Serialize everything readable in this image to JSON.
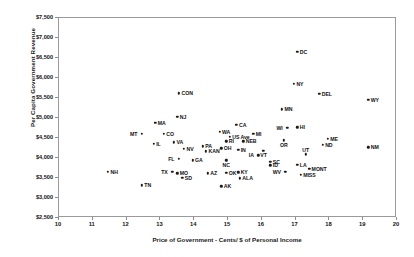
{
  "chart_data": {
    "type": "scatter",
    "title": "",
    "xlabel": "Price of Government - Cents/ $ of Personal Income",
    "ylabel": "Per Capita Government Revenue",
    "xlim": [
      10,
      20
    ],
    "ylim": [
      2500,
      7500
    ],
    "xticks": [
      "10",
      "11",
      "12",
      "13",
      "14",
      "15",
      "16",
      "17",
      "18",
      "19",
      "20"
    ],
    "yticks": [
      "$2,500",
      "$3,000",
      "$3,500",
      "$4,000",
      "$4,500",
      "$5,000",
      "$5,500",
      "$6,000",
      "$6,500",
      "$7,000",
      "$7,500"
    ],
    "grid": false,
    "legend": "none",
    "marker_color": "#1c1c1c",
    "frame_color": "#9a9a9a",
    "points": [
      {
        "label": "DC",
        "x": 17.05,
        "y": 6650,
        "side": "right"
      },
      {
        "label": "NY",
        "x": 16.95,
        "y": 5850,
        "side": "right"
      },
      {
        "label": "DEL",
        "x": 17.7,
        "y": 5600,
        "side": "right"
      },
      {
        "label": "WY",
        "x": 19.15,
        "y": 5450,
        "side": "right"
      },
      {
        "label": "CON",
        "x": 13.55,
        "y": 5620,
        "side": "right"
      },
      {
        "label": "NJ",
        "x": 13.5,
        "y": 5030,
        "side": "right"
      },
      {
        "label": "MA",
        "x": 12.85,
        "y": 4880,
        "side": "right"
      },
      {
        "label": "MN",
        "x": 16.6,
        "y": 5220,
        "side": "right"
      },
      {
        "label": "CA",
        "x": 15.25,
        "y": 4830,
        "side": "right"
      },
      {
        "label": "WI",
        "x": 16.75,
        "y": 4760,
        "side": "left"
      },
      {
        "label": "HI",
        "x": 17.05,
        "y": 4770,
        "side": "right"
      },
      {
        "label": "MT",
        "x": 12.45,
        "y": 4610,
        "side": "left"
      },
      {
        "label": "CO",
        "x": 13.1,
        "y": 4600,
        "side": "right"
      },
      {
        "label": "WA",
        "x": 14.75,
        "y": 4660,
        "side": "right"
      },
      {
        "label": "MI",
        "x": 15.75,
        "y": 4610,
        "side": "right"
      },
      {
        "label": "ME",
        "x": 17.95,
        "y": 4480,
        "side": "right"
      },
      {
        "label": "ND",
        "x": 17.8,
        "y": 4330,
        "side": "right"
      },
      {
        "label": "OR",
        "x": 16.65,
        "y": 4440,
        "side": "below"
      },
      {
        "label": "NM",
        "x": 19.15,
        "y": 4270,
        "side": "right"
      },
      {
        "label": "US Ave",
        "x": 15.05,
        "y": 4530,
        "side": "right"
      },
      {
        "label": "RI",
        "x": 14.95,
        "y": 4420,
        "side": "right"
      },
      {
        "label": "NEB",
        "x": 15.45,
        "y": 4420,
        "side": "right"
      },
      {
        "label": "IL",
        "x": 12.8,
        "y": 4360,
        "side": "right"
      },
      {
        "label": "VA",
        "x": 13.4,
        "y": 4390,
        "side": "right"
      },
      {
        "label": "NV",
        "x": 13.7,
        "y": 4230,
        "side": "right"
      },
      {
        "label": "PA",
        "x": 14.25,
        "y": 4290,
        "side": "right"
      },
      {
        "label": "OH",
        "x": 14.8,
        "y": 4240,
        "side": "right"
      },
      {
        "label": "KAN",
        "x": 14.35,
        "y": 4170,
        "side": "right"
      },
      {
        "label": "IN",
        "x": 15.3,
        "y": 4200,
        "side": "right"
      },
      {
        "label": "VT",
        "x": 16.05,
        "y": 4180,
        "side": "below"
      },
      {
        "label": "UT",
        "x": 17.3,
        "y": 4090,
        "side": "above"
      },
      {
        "label": "IA",
        "x": 15.9,
        "y": 4070,
        "side": "left"
      },
      {
        "label": "FL",
        "x": 13.55,
        "y": 3980,
        "side": "left"
      },
      {
        "label": "GA",
        "x": 13.95,
        "y": 3940,
        "side": "right"
      },
      {
        "label": "NC",
        "x": 14.95,
        "y": 3940,
        "side": "below"
      },
      {
        "label": "SC",
        "x": 16.25,
        "y": 3900,
        "side": "right"
      },
      {
        "label": "ID",
        "x": 16.25,
        "y": 3820,
        "side": "right"
      },
      {
        "label": "LA",
        "x": 17.05,
        "y": 3830,
        "side": "right"
      },
      {
        "label": "MONT",
        "x": 17.4,
        "y": 3730,
        "side": "right"
      },
      {
        "label": "TX",
        "x": 13.35,
        "y": 3660,
        "side": "left"
      },
      {
        "label": "MO",
        "x": 13.5,
        "y": 3620,
        "side": "right"
      },
      {
        "label": "SD",
        "x": 13.65,
        "y": 3510,
        "side": "right"
      },
      {
        "label": "AZ",
        "x": 14.4,
        "y": 3620,
        "side": "right"
      },
      {
        "label": "OK",
        "x": 14.95,
        "y": 3630,
        "side": "right"
      },
      {
        "label": "KY",
        "x": 15.3,
        "y": 3640,
        "side": "right"
      },
      {
        "label": "ALA",
        "x": 15.35,
        "y": 3490,
        "side": "right"
      },
      {
        "label": "WV",
        "x": 16.7,
        "y": 3650,
        "side": "left"
      },
      {
        "label": "MISS",
        "x": 17.15,
        "y": 3580,
        "side": "right"
      },
      {
        "label": "AK",
        "x": 14.8,
        "y": 3290,
        "side": "right"
      },
      {
        "label": "NH",
        "x": 11.45,
        "y": 3650,
        "side": "right"
      },
      {
        "label": "TN",
        "x": 12.45,
        "y": 3320,
        "side": "right"
      }
    ]
  }
}
